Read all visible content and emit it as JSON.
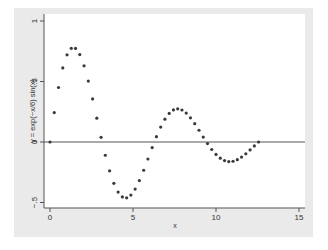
{
  "chart_data": {
    "type": "scatter",
    "title": "",
    "xlabel": "x",
    "ylabel": "y = exp(−x/6) sin(x)",
    "xlim": [
      0,
      15
    ],
    "ylim": [
      -0.5,
      1
    ],
    "x_ticks": [
      0,
      5,
      10,
      15
    ],
    "x_tick_labels": [
      "0",
      "5",
      "10",
      "15"
    ],
    "y_ticks": [
      -0.5,
      0,
      0.5,
      1
    ],
    "y_tick_labels": [
      "−.5",
      "0",
      ".5",
      "1"
    ],
    "reference_line": {
      "y": 0
    },
    "grid": false,
    "legend": null,
    "function": "y = exp(-x/6) * sin(x)",
    "x_range": [
      0,
      12.566
    ],
    "n_points": 50,
    "series": [
      {
        "name": "y = exp(-x/6) sin(x)",
        "marker": "circle",
        "color": "#3a3a3a"
      }
    ],
    "key_points": [
      {
        "x": 0,
        "y": 0
      },
      {
        "x": 1.4,
        "y": 0.78
      },
      {
        "x": 3.14,
        "y": 0
      },
      {
        "x": 4.55,
        "y": -0.46
      },
      {
        "x": 6.28,
        "y": 0
      },
      {
        "x": 7.7,
        "y": 0.28
      },
      {
        "x": 9.42,
        "y": 0
      },
      {
        "x": 10.85,
        "y": -0.16
      },
      {
        "x": 12.57,
        "y": 0
      }
    ]
  },
  "colors": {
    "outer_bg": "#eaeaea",
    "plot_bg": "#ffffff",
    "axis": "#555555",
    "marker": "#3a3a3a",
    "zero_line": "#555555"
  }
}
